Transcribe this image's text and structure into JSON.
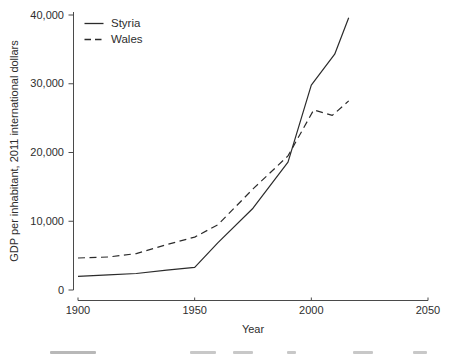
{
  "chart_data": {
    "type": "line",
    "title": "",
    "xlabel": "Year",
    "ylabel": "GDP per inhabitant, 2011 international dollars",
    "xlim": [
      1900,
      2050
    ],
    "ylim": [
      0,
      40000
    ],
    "x_ticks": [
      1900,
      1950,
      2000,
      2050
    ],
    "x_tick_labels": [
      "1900",
      "1950",
      "2000",
      "2050"
    ],
    "y_ticks": [
      0,
      10000,
      20000,
      30000,
      40000
    ],
    "y_tick_labels": [
      "0",
      "10,000",
      "20,000",
      "30,000",
      "40,000"
    ],
    "grid": false,
    "legend_position": "top-left",
    "axis_color": "#4a4a4a",
    "text_color": "#2e2e2e",
    "series": [
      {
        "name": "Styria",
        "style": "solid",
        "color": "#2b2b2b",
        "points": [
          [
            1900,
            2000
          ],
          [
            1913,
            2200
          ],
          [
            1925,
            2400
          ],
          [
            1938,
            2900
          ],
          [
            1950,
            3300
          ],
          [
            1960,
            6900
          ],
          [
            1975,
            11900
          ],
          [
            1990,
            18600
          ],
          [
            2000,
            29800
          ],
          [
            2010,
            34300
          ],
          [
            2016,
            39600
          ]
        ]
      },
      {
        "name": "Wales",
        "style": "dashed",
        "color": "#2b2b2b",
        "points": [
          [
            1900,
            4650
          ],
          [
            1913,
            4800
          ],
          [
            1925,
            5300
          ],
          [
            1938,
            6600
          ],
          [
            1950,
            7700
          ],
          [
            1960,
            9500
          ],
          [
            1975,
            14700
          ],
          [
            1990,
            19500
          ],
          [
            2001,
            26200
          ],
          [
            2009,
            25400
          ],
          [
            2016,
            27500
          ]
        ]
      }
    ]
  }
}
